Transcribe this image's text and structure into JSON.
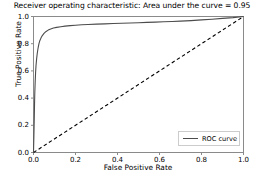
{
  "chart_data": {
    "type": "line",
    "title": "Receiver operating characteristic: Area under the       curve = 0.95",
    "xlabel": "False Positive Rate",
    "ylabel": "True Positive Rate",
    "xlim": [
      0.0,
      1.0
    ],
    "ylim": [
      0.0,
      1.0
    ],
    "grid": false,
    "legend_position": "lower right",
    "xticks": [
      "0.0",
      "0.2",
      "0.4",
      "0.6",
      "0.8",
      "1.0"
    ],
    "xtick_values": [
      0.0,
      0.2,
      0.4,
      0.6,
      0.8,
      1.0
    ],
    "yticks": [
      "0.0",
      "0.2",
      "0.4",
      "0.6",
      "0.8",
      "1.0"
    ],
    "ytick_values": [
      0.0,
      0.2,
      0.4,
      0.6,
      0.8,
      1.0
    ],
    "auc": 0.95,
    "series": [
      {
        "name": "ROC curve",
        "style": "solid",
        "color": "#4c4c4c",
        "x": [
          0.0,
          0.002,
          0.004,
          0.005,
          0.006,
          0.008,
          0.01,
          0.012,
          0.015,
          0.018,
          0.022,
          0.026,
          0.03,
          0.036,
          0.042,
          0.05,
          0.06,
          0.07,
          0.082,
          0.095,
          0.11,
          0.13,
          0.15,
          0.175,
          0.2,
          0.23,
          0.26,
          0.3,
          0.34,
          0.38,
          0.42,
          0.46,
          0.5,
          0.54,
          0.58,
          0.62,
          0.66,
          0.7,
          0.75,
          0.8,
          0.85,
          0.9,
          0.95,
          1.0
        ],
        "y": [
          0.0,
          0.13,
          0.28,
          0.36,
          0.43,
          0.52,
          0.59,
          0.64,
          0.69,
          0.73,
          0.77,
          0.8,
          0.822,
          0.843,
          0.86,
          0.876,
          0.89,
          0.9,
          0.908,
          0.915,
          0.92,
          0.925,
          0.929,
          0.933,
          0.936,
          0.939,
          0.941,
          0.944,
          0.946,
          0.948,
          0.95,
          0.952,
          0.954,
          0.957,
          0.959,
          0.961,
          0.963,
          0.966,
          0.97,
          0.975,
          0.98,
          0.986,
          0.992,
          1.0
        ]
      },
      {
        "name": "chance-diagonal",
        "style": "dashed",
        "color": "#000000",
        "x": [
          0.0,
          1.0
        ],
        "y": [
          0.0,
          1.0
        ]
      }
    ],
    "legend_entries": [
      "ROC curve"
    ]
  },
  "legend": {
    "roc_label": "ROC curve"
  },
  "colors": {
    "curve": "#4c4c4c",
    "diagonal": "#000000",
    "axis": "#8a8a8a",
    "background": "#ffffff",
    "legend_border": "#cccccc"
  }
}
